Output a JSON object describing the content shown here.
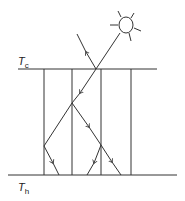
{
  "labels": {
    "top": {
      "main": "T",
      "sub": "c"
    },
    "bottom": {
      "main": "T",
      "sub": "h"
    }
  },
  "colors": {
    "line": "#333333",
    "background": "#ffffff"
  },
  "elements": {
    "sun": "sun-icon",
    "top_boundary": "cold-plate-line",
    "bottom_boundary": "hot-plate-line",
    "vertical_lines": 4,
    "ray_arrows": [
      "reflected-ray-up",
      "incident-ray-down",
      "branch-left-down",
      "branch-right-down",
      "split-left-down",
      "split-right-down"
    ]
  }
}
